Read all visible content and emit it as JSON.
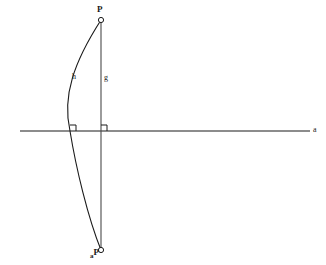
{
  "figure": {
    "background_color": "#ffffff",
    "stroke_color": "#1a1a1a",
    "width": 326,
    "height": 265,
    "labels": {
      "point_top": "P",
      "point_bottom_sub": "a",
      "point_bottom": "P",
      "chord": "g",
      "arc": "h",
      "axis": "a"
    },
    "elements": {
      "horizontal_axis": {
        "name": "horizontal axis line",
        "x1": 20,
        "y1": 131,
        "x2": 310,
        "y2": 131
      },
      "vertical_chord": {
        "name": "vertical chord line g",
        "x1": 101,
        "y1": 20,
        "x2": 101,
        "y2": 250
      },
      "arc": {
        "name": "arc h",
        "start_x": 101,
        "start_y": 20,
        "apex_x": 70,
        "apex_y": 131,
        "end_x": 101,
        "end_y": 250
      },
      "right_angle_left": {
        "name": "right angle marker at arc vertex",
        "x": 70,
        "y": 131,
        "size": 6
      },
      "right_angle_right": {
        "name": "right angle marker at chord intersection",
        "x": 101,
        "y": 131,
        "size": 6
      },
      "marker_top": {
        "name": "open circle point P top",
        "cx": 101,
        "cy": 20,
        "r": 2.6
      },
      "marker_bottom": {
        "name": "open circle point P bottom",
        "cx": 101,
        "cy": 250,
        "r": 2.6
      }
    }
  }
}
